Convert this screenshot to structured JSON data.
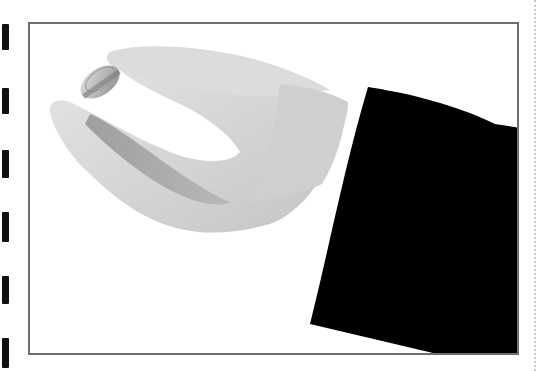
{
  "image": {
    "description": "Black-and-white photo of a hand holding a coin between thumb and index finger, emerging from a black suit sleeve with white shirt cuff",
    "subject": "hand holding coin",
    "frame_color": "#6e6e6e",
    "sleeve_color": "#000000",
    "skin_tone": "#d4d4d4",
    "coin_color": "#bdbdbd",
    "background_color": "#ffffff"
  },
  "edge_marks": {
    "count": 6,
    "positions_y": [
      28,
      90,
      152,
      215,
      278,
      340
    ]
  },
  "right_guide": {
    "style": "dotted",
    "color": "#c8c8c8"
  }
}
